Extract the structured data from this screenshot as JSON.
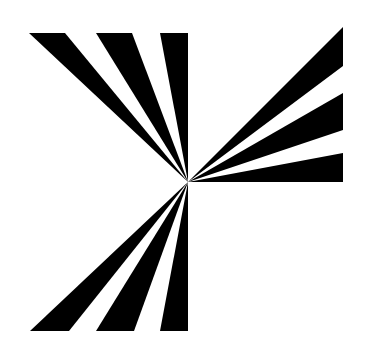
{
  "graphic": {
    "background": "#ffffff",
    "fill": "#000000",
    "center": [
      188,
      182
    ],
    "groups": [
      {
        "name": "top-left-rays",
        "wedges": [
          [
            [
              29,
              33
            ],
            [
              65,
              33
            ]
          ],
          [
            [
              96,
              33
            ],
            [
              132,
              33
            ]
          ],
          [
            [
              160,
              33
            ],
            [
              188,
              33
            ]
          ]
        ]
      },
      {
        "name": "right-rays",
        "wedges": [
          [
            [
              343,
              27
            ],
            [
              343,
              66
            ]
          ],
          [
            [
              343,
              93
            ],
            [
              343,
              130
            ]
          ],
          [
            [
              343,
              153
            ],
            [
              343,
              182
            ]
          ]
        ]
      },
      {
        "name": "bottom-left-rays",
        "wedges": [
          [
            [
              30,
              331
            ],
            [
              69,
              331
            ]
          ],
          [
            [
              96,
              331
            ],
            [
              134,
              331
            ]
          ],
          [
            [
              160,
              331
            ],
            [
              188,
              331
            ]
          ]
        ]
      }
    ]
  }
}
